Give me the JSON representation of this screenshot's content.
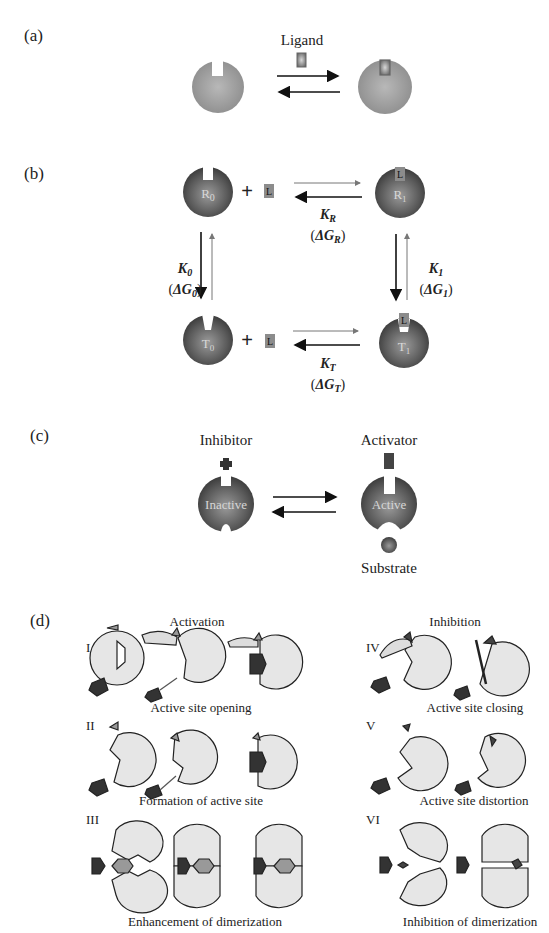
{
  "header_fragment": "",
  "panels": {
    "a": {
      "label": "(a)",
      "ligand_label": "Ligand"
    },
    "b": {
      "label": "(b)",
      "species": {
        "R0": "R",
        "R0_sub": "0",
        "R1": "R",
        "R1_sub": "1",
        "T0": "T",
        "T0_sub": "0",
        "T1": "T",
        "T1_sub": "1",
        "ligand": "L",
        "plus": "+"
      },
      "constants": {
        "KR": {
          "K": "K",
          "sub": "R",
          "dG": "ΔG",
          "dG_sub": "R"
        },
        "K0": {
          "K": "K",
          "sub": "0",
          "dG": "ΔG",
          "dG_sub": "0"
        },
        "K1": {
          "K": "K",
          "sub": "1",
          "dG": "ΔG",
          "dG_sub": "1"
        },
        "KT": {
          "K": "K",
          "sub": "T",
          "dG": "ΔG",
          "dG_sub": "T"
        }
      }
    },
    "c": {
      "label": "(c)",
      "inhibitor_label": "Inhibitor",
      "activator_label": "Activator",
      "inactive_label": "Inactive",
      "active_label": "Active",
      "substrate_label": "Substrate"
    },
    "d": {
      "label": "(d)",
      "activation_title": "Activation",
      "inhibition_title": "Inhibition",
      "rows": [
        {
          "roman": "I",
          "caption": "Active site opening"
        },
        {
          "roman": "II",
          "caption": "Formation of active site"
        },
        {
          "roman": "III",
          "caption": "Enhancement of dimerization"
        },
        {
          "roman": "IV",
          "caption": "Active site closing"
        },
        {
          "roman": "V",
          "caption": "Active site distortion"
        },
        {
          "roman": "VI",
          "caption": "Inhibition of dimerization"
        }
      ]
    }
  },
  "colors": {
    "sphere_light": "#a9a9a9",
    "sphere_dark": "#4a4a4a",
    "protein_fill": "#e6e6e6",
    "effector_dark": "#333333",
    "ligand_gray": "#8c8c8c"
  }
}
